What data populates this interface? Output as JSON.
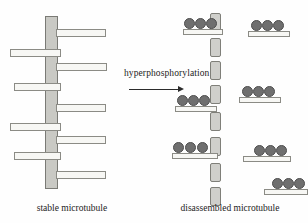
{
  "figure": {
    "width": 308,
    "height": 223,
    "background": "#fefefe",
    "type": "biological-schematic",
    "topic": "Tau hyperphosphorylation and microtubule disassembly"
  },
  "reaction": {
    "label": "hyperphosphorylation",
    "arrow": "right-arrow",
    "label_x": 124,
    "label_y": 68,
    "arrow_x": 129,
    "arrow_y": 89,
    "arrow_width": 50
  },
  "captions": {
    "left": "stable microtubule",
    "right": "disassembled microtubule",
    "left_x": 22,
    "left_y": 203,
    "left_w": 100,
    "right_x": 165,
    "right_y": 203,
    "right_w": 130
  },
  "colors": {
    "microtubule_fill": "#c9c9c4",
    "microtubule_stroke": "#7a7a75",
    "tau_fill": "#f7f7f4",
    "tau_stroke": "#8b8b85",
    "phosphate_fill": "#6f6f6f",
    "phosphate_stroke": "#4e4e4e",
    "tubulin_fill": "#cfcfcb",
    "tubulin_stroke": "#7f7f79",
    "text": "#1c1c1c",
    "arrow": "#2b2b2b"
  },
  "left_panel": {
    "name": "stable-microtubule-diagram",
    "microtubule": {
      "x": 45,
      "y": 16,
      "width": 13,
      "height": 173
    },
    "tau_arms": [
      {
        "side": "right",
        "x": 56,
        "y": 29,
        "width": 50
      },
      {
        "side": "left",
        "x": 10,
        "y": 49,
        "width": 51
      },
      {
        "side": "right",
        "x": 56,
        "y": 63,
        "width": 51
      },
      {
        "side": "left",
        "x": 14,
        "y": 83,
        "width": 47
      },
      {
        "side": "right",
        "x": 56,
        "y": 104,
        "width": 50
      },
      {
        "side": "left",
        "x": 10,
        "y": 123,
        "width": 51
      },
      {
        "side": "right",
        "x": 56,
        "y": 136,
        "width": 50
      },
      {
        "side": "left",
        "x": 14,
        "y": 152,
        "width": 47
      },
      {
        "side": "right",
        "x": 56,
        "y": 171,
        "width": 50
      }
    ],
    "tau_arm_count": 9
  },
  "right_panel": {
    "name": "disassembled-microtubule-diagram",
    "tubulin_subunits": [
      {
        "x": 210,
        "y": 13
      },
      {
        "x": 210,
        "y": 38
      },
      {
        "x": 210,
        "y": 61
      },
      {
        "x": 210,
        "y": 85
      },
      {
        "x": 210,
        "y": 112
      },
      {
        "x": 210,
        "y": 137
      },
      {
        "x": 210,
        "y": 163
      },
      {
        "x": 210,
        "y": 187
      }
    ],
    "tubulin_count": 8,
    "free_tau": [
      {
        "x": 183,
        "y": 18,
        "width": 40,
        "phosphates": 3,
        "phos_offsets": [
          1,
          12,
          23
        ]
      },
      {
        "x": 248,
        "y": 20,
        "width": 42,
        "phosphates": 3,
        "phos_offsets": [
          3,
          14,
          25
        ]
      },
      {
        "x": 239,
        "y": 86,
        "width": 42,
        "phosphates": 3,
        "phos_offsets": [
          3,
          14,
          25
        ]
      },
      {
        "x": 175,
        "y": 95,
        "width": 42,
        "phosphates": 3,
        "phos_offsets": [
          2,
          13,
          24
        ]
      },
      {
        "x": 172,
        "y": 142,
        "width": 46,
        "phosphates": 3,
        "phos_offsets": [
          1,
          13,
          25
        ]
      },
      {
        "x": 243,
        "y": 145,
        "width": 48,
        "phosphates": 3,
        "phos_offsets": [
          11,
          22,
          33
        ]
      },
      {
        "x": 264,
        "y": 178,
        "width": 44,
        "phosphates": 3,
        "phos_offsets": [
          8,
          19,
          30
        ]
      }
    ],
    "free_tau_count": 7
  }
}
